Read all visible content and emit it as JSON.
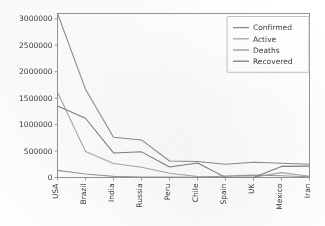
{
  "chart_data": {
    "type": "line",
    "title": "",
    "xlabel": "",
    "ylabel": "",
    "categories": [
      "USA",
      "Brazil",
      "India",
      "Russia",
      "Peru",
      "Chile",
      "Spain",
      "UK",
      "Mexico",
      "Iran"
    ],
    "ylim": [
      0,
      3100000
    ],
    "xlim": [
      0,
      9
    ],
    "grid": false,
    "legend_position": "upper right",
    "yticks": [
      0,
      500000,
      1000000,
      1500000,
      2000000,
      2500000,
      3000000
    ],
    "ytick_labels": [
      "0",
      "500000",
      "1000000",
      "1500000",
      "2000000",
      "2500000",
      "3000000"
    ],
    "xtick_labels": [
      "USA",
      "Brazil",
      "India",
      "Russia",
      "Peru",
      "Chile",
      "Spain",
      "UK",
      "Mexico",
      "Iran"
    ],
    "series": [
      {
        "name": "Confirmed",
        "color": "#8c8c8c",
        "values": [
          3100000,
          1670000,
          760000,
          710000,
          312000,
          303000,
          252000,
          288000,
          268000,
          252000
        ]
      },
      {
        "name": "Active",
        "color": "#a8a8a8",
        "values": [
          1610000,
          490000,
          265000,
          195000,
          80000,
          18000,
          9000,
          5000,
          92000,
          25000
        ]
      },
      {
        "name": "Deaths",
        "color": "#9b9b9b",
        "values": [
          135000,
          66000,
          21000,
          11000,
          11200,
          6500,
          28400,
          44600,
          32000,
          12400
        ]
      },
      {
        "name": "Recovered",
        "color": "#7e7e7e",
        "values": [
          1350000,
          1120000,
          465000,
          485000,
          200000,
          275000,
          2000,
          2000,
          210000,
          215000
        ]
      }
    ]
  },
  "legend": {
    "entries": [
      {
        "label": "Confirmed"
      },
      {
        "label": "Active"
      },
      {
        "label": "Deaths"
      },
      {
        "label": "Recovered"
      }
    ]
  },
  "axes": {
    "y_tick_labels": [
      "3000000",
      "2500000",
      "2000000",
      "1500000",
      "1000000",
      "500000",
      "0"
    ],
    "x_tick_labels": [
      "USA",
      "Brazil",
      "India",
      "Russia",
      "Peru",
      "Chile",
      "Spain",
      "UK",
      "Mexico",
      "Iran"
    ]
  }
}
